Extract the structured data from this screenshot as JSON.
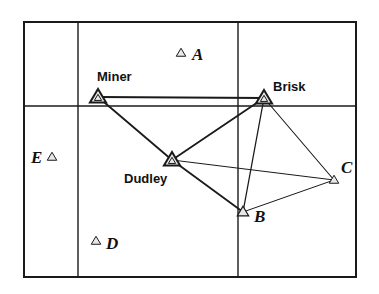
{
  "figure": {
    "background_color": "#ffffff",
    "line_color": "#1a1a1a",
    "marker_fill": "#e8e8e8",
    "marker_stroke": "#1a1a1a",
    "grid": {
      "outer_box": {
        "x": 24,
        "y": 22,
        "width": 332,
        "height": 255
      },
      "vertical_lines_x": [
        78,
        238
      ],
      "horizontal_lines_y": [
        106
      ],
      "border_width": 2,
      "inner_line_width": 1.4
    },
    "nodes": [
      {
        "id": "A",
        "label": "A",
        "label_style": "serif-italic",
        "label_position": "right",
        "marker": {
          "x": 181,
          "y": 53
        },
        "label_xy": {
          "x": 192,
          "y": 46
        },
        "marker_size": "small"
      },
      {
        "id": "Miner",
        "label": "Miner",
        "label_style": "sans-bold",
        "label_position": "above-right",
        "marker": {
          "x": 98,
          "y": 97
        },
        "label_xy": {
          "x": 97,
          "y": 70
        },
        "marker_size": "large"
      },
      {
        "id": "Brisk",
        "label": "Brisk",
        "label_style": "sans-bold",
        "label_position": "right-above",
        "marker": {
          "x": 264,
          "y": 98
        },
        "label_xy": {
          "x": 273,
          "y": 80
        },
        "marker_size": "large"
      },
      {
        "id": "E",
        "label": "E",
        "label_style": "serif-italic",
        "label_position": "left",
        "marker": {
          "x": 52,
          "y": 157
        },
        "label_xy": {
          "x": 31,
          "y": 149
        },
        "marker_size": "small"
      },
      {
        "id": "Dudley",
        "label": "Dudley",
        "label_style": "sans-bold",
        "label_position": "below-left",
        "marker": {
          "x": 172,
          "y": 160
        },
        "label_xy": {
          "x": 124,
          "y": 172
        },
        "marker_size": "large"
      },
      {
        "id": "C",
        "label": "C",
        "label_style": "serif-italic",
        "label_position": "above-right",
        "marker": {
          "x": 334,
          "y": 180
        },
        "label_xy": {
          "x": 341,
          "y": 159
        },
        "marker_size": "small"
      },
      {
        "id": "B",
        "label": "B",
        "label_style": "serif-italic",
        "label_position": "below-right",
        "marker": {
          "x": 243,
          "y": 212
        },
        "label_xy": {
          "x": 254,
          "y": 208
        },
        "marker_size": "medium"
      },
      {
        "id": "D",
        "label": "D",
        "label_style": "serif-italic",
        "label_position": "right",
        "marker": {
          "x": 96,
          "y": 241
        },
        "label_xy": {
          "x": 106,
          "y": 235
        },
        "marker_size": "small"
      }
    ],
    "edges": [
      {
        "from": "Miner",
        "to": "Brisk",
        "width": 1.8
      },
      {
        "from": "Miner",
        "to": "Dudley",
        "width": 1.8
      },
      {
        "from": "Dudley",
        "to": "Brisk",
        "width": 1.8
      },
      {
        "from": "Dudley",
        "to": "B",
        "width": 1.8
      },
      {
        "from": "Dudley",
        "to": "C",
        "width": 1.0
      },
      {
        "from": "Brisk",
        "to": "B",
        "width": 1.3
      },
      {
        "from": "Brisk",
        "to": "C",
        "width": 1.1
      },
      {
        "from": "B",
        "to": "C",
        "width": 1.0
      }
    ]
  }
}
